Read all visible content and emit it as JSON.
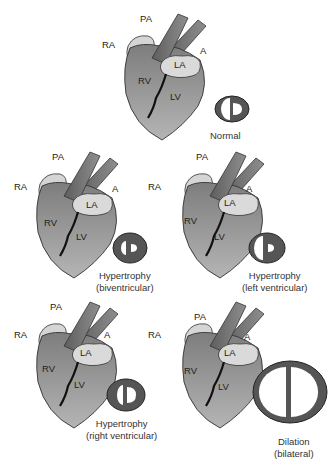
{
  "figure": {
    "panels": [
      {
        "id": "normal",
        "caption_line1": "Normal",
        "caption_line2": "",
        "labels": {
          "pa": "PA",
          "ra": "RA",
          "a": "A",
          "la": "LA",
          "rv": "RV",
          "lv": "LV"
        }
      },
      {
        "id": "hyper-bi",
        "caption_line1": "Hypertrophy",
        "caption_line2": "(biventricular)",
        "labels": {
          "pa": "PA",
          "ra": "RA",
          "a": "A",
          "la": "LA",
          "rv": "RV",
          "lv": "LV"
        }
      },
      {
        "id": "hyper-left",
        "caption_line1": "Hypertrophy",
        "caption_line2": "(left ventricular)",
        "labels": {
          "pa": "PA",
          "ra": "RA",
          "a": "A",
          "la": "LA",
          "rv": "RV",
          "lv": "LV"
        }
      },
      {
        "id": "hyper-right",
        "caption_line1": "Hypertrophy",
        "caption_line2": "(right ventricular)",
        "labels": {
          "pa": "PA",
          "ra": "RA",
          "a": "A",
          "la": "LA",
          "rv": "RV",
          "lv": "LV"
        }
      },
      {
        "id": "dilation",
        "caption_line1": "Dilation",
        "caption_line2": "(bilateral)",
        "labels": {
          "pa": "PA",
          "ra": "RA",
          "a": "A",
          "la": "LA",
          "rv": "RV",
          "lv": "LV"
        }
      }
    ],
    "colors": {
      "heart": "#8a8a8a",
      "vessel": "#6e6e6e",
      "atrium": "#d9d9d9",
      "outline": "#333333",
      "septum": "#111111"
    }
  }
}
